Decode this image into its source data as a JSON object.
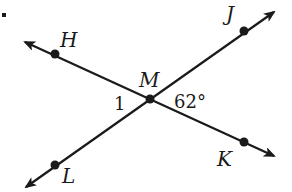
{
  "diagram": {
    "stroke_color": "#1a1a1a",
    "background": "#ffffff",
    "intersection": {
      "label": "M",
      "x": 150,
      "y": 99
    },
    "points": [
      {
        "id": "H",
        "label": "H",
        "x": 55,
        "y": 54
      },
      {
        "id": "J",
        "label": "J",
        "x": 244,
        "y": 31
      },
      {
        "id": "L",
        "label": "L",
        "x": 55,
        "y": 165
      },
      {
        "id": "K",
        "label": "K",
        "x": 244,
        "y": 142
      }
    ],
    "lines": [
      {
        "name": "line-HK",
        "through": [
          "H",
          "M",
          "K"
        ],
        "arrow_start": [
          23,
          41
        ],
        "arrow_end": [
          276,
          157
        ]
      },
      {
        "name": "line-LJ",
        "through": [
          "L",
          "M",
          "J"
        ],
        "arrow_start": [
          24,
          189
        ],
        "arrow_end": [
          276,
          10
        ]
      }
    ],
    "angles": [
      {
        "label": "1",
        "position": "left of M, between H and L"
      },
      {
        "label": "62°",
        "position": "right of M, between J and K"
      }
    ]
  },
  "labels": {
    "H": "H",
    "J": "J",
    "M": "M",
    "L": "L",
    "K": "K",
    "angle1": "1",
    "angle62": "62°"
  }
}
